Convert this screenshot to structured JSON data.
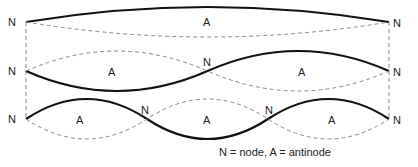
{
  "diagram": {
    "colors": {
      "solid": "#111111",
      "dashed": "#888888",
      "text": "#222222"
    },
    "rows": [
      {
        "name": "first-harmonic",
        "labels": {
          "left_node": "N",
          "right_node": "N",
          "antinodes": [
            "A"
          ]
        }
      },
      {
        "name": "second-harmonic",
        "labels": {
          "left_node": "N",
          "mid_nodes": [
            "N"
          ],
          "right_node": "N",
          "antinodes": [
            "A",
            "A"
          ]
        }
      },
      {
        "name": "third-harmonic",
        "labels": {
          "left_node": "N",
          "mid_nodes": [
            "N",
            "N"
          ],
          "right_node": "N",
          "antinodes": [
            "A",
            "A",
            "A"
          ]
        }
      }
    ],
    "legend": "N = node, A = antinode"
  }
}
